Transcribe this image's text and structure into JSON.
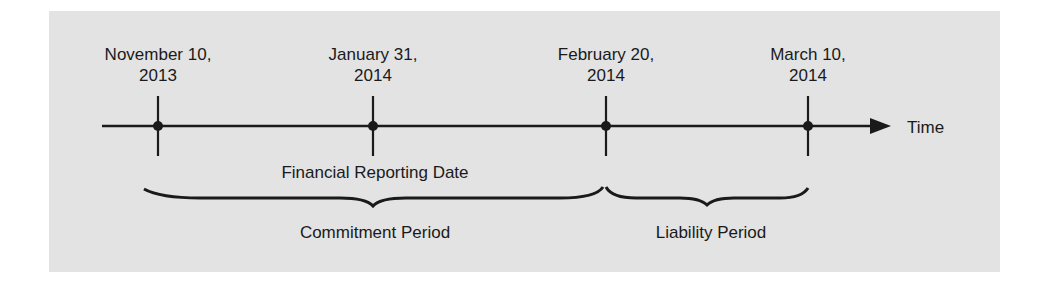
{
  "timeline": {
    "axis_label": "Time",
    "points": [
      {
        "line1": "November 10,",
        "line2": "2013",
        "x": 158
      },
      {
        "line1": "January 31,",
        "line2": "2014",
        "x": 373
      },
      {
        "line1": "February 20,",
        "line2": "2014",
        "x": 606
      },
      {
        "line1": "March 10,",
        "line2": "2014",
        "x": 808
      }
    ],
    "annotation": "Financial Reporting Date"
  },
  "periods": [
    {
      "label": "Commitment Period",
      "from": "November 10, 2013",
      "to": "February 20, 2014"
    },
    {
      "label": "Liability Period",
      "from": "February 20, 2014",
      "to": "March 10, 2014"
    }
  ],
  "colors": {
    "background": "#e3e3e3",
    "ink": "#1a1a1a"
  }
}
